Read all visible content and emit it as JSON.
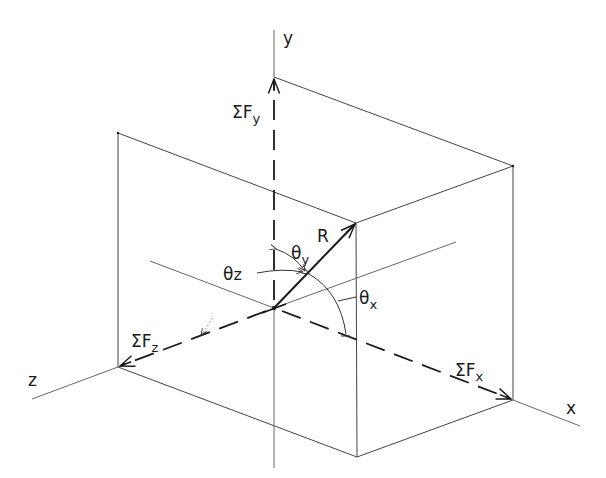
{
  "diagram": {
    "type": "3D force resultant vector components (isometric)",
    "colors": {
      "line": "#1a1a1a",
      "thin": "#555555",
      "background": "#ffffff"
    },
    "axes": [
      {
        "id": "y",
        "label": "y"
      },
      {
        "id": "x",
        "label": "x"
      },
      {
        "id": "z",
        "label": "z"
      }
    ],
    "forces": [
      {
        "id": "fy",
        "symbol": "ΣF",
        "sub": "y"
      },
      {
        "id": "fx",
        "symbol": "ΣF",
        "sub": "x"
      },
      {
        "id": "fz",
        "symbol": "ΣF",
        "sub": "z"
      }
    ],
    "resultant": {
      "label": "R"
    },
    "angles": [
      {
        "id": "theta_y",
        "symbol": "θ",
        "sub": "y"
      },
      {
        "id": "theta_z",
        "symbol": "θ",
        "sub": "z"
      },
      {
        "id": "theta_x",
        "symbol": "θ",
        "sub": "x"
      }
    ]
  }
}
